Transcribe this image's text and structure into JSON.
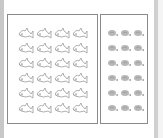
{
  "screen": {
    "description": "Two bordered panels with repeated picture icons",
    "left_panel": {
      "icon": "fish-outline-icon",
      "columns": 4,
      "rows": 6,
      "count": 24
    },
    "right_panel": {
      "icon": "shell-icon",
      "columns": 3,
      "rows": 6,
      "count": 18
    },
    "colors": {
      "border": "#8a8a8a",
      "icon_stroke": "#9a9a9a",
      "shell_fill": "#b8b8b8",
      "edge": "#c8c8c8"
    }
  }
}
